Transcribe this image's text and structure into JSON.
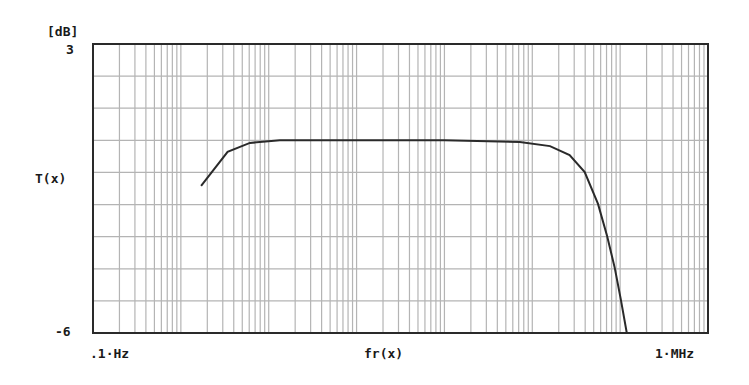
{
  "chart_data": {
    "type": "line",
    "title": "",
    "xlabel": "fr(x)",
    "ylabel": "T(x)",
    "y_unit_label": "[dB]",
    "xscale": "log",
    "xlim": [
      0.1,
      1000000
    ],
    "ylim": [
      -6,
      3
    ],
    "x_tick_labels": [
      ".1·Hz",
      "1·MHz"
    ],
    "y_tick_labels": [
      "3",
      "-6"
    ],
    "grid": true,
    "grid_y_step_db": 1,
    "grid_x": "log decades with 2-9 minor lines",
    "legend": null,
    "series": [
      {
        "name": "T(x)",
        "x": [
          1.7,
          3.4,
          6.1,
          13.4,
          100,
          1000,
          7200,
          15900,
          26600,
          39500,
          56000,
          71000,
          87000,
          102000,
          119000
        ],
        "values": [
          -1.42,
          -0.36,
          -0.08,
          0.0,
          0.0,
          0.0,
          -0.05,
          -0.18,
          -0.46,
          -0.99,
          -1.98,
          -2.98,
          -3.98,
          -4.97,
          -6.0
        ]
      }
    ]
  },
  "labels": {
    "y_unit": "[dB]",
    "y_max": "3",
    "y_min": "-6",
    "y_axis": "T(x)",
    "x_min": ".1·Hz",
    "x_max": "1·MHz",
    "x_axis": "fr(x)"
  },
  "colors": {
    "grid": "#b4b4b4",
    "frame": "#2a2a2a",
    "curve": "#2a2a2a",
    "background": "#ffffff"
  }
}
